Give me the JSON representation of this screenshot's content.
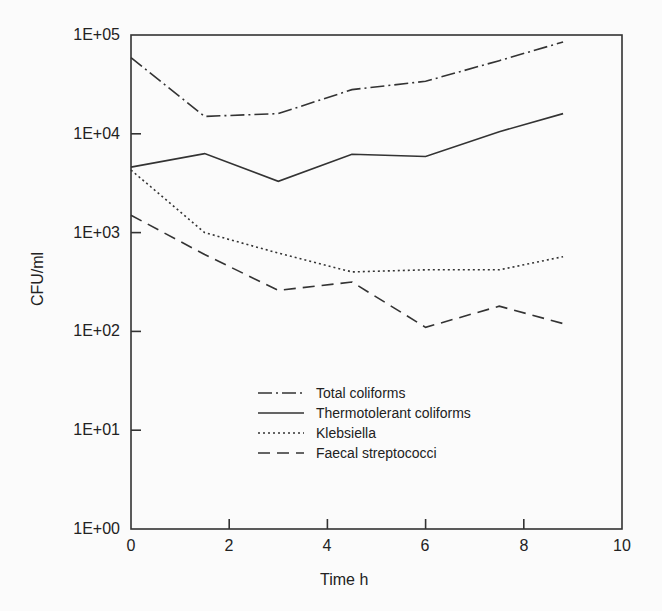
{
  "chart_data": {
    "type": "line",
    "title": "",
    "xlabel": "Time h",
    "ylabel": "CFU/ml",
    "xlim": [
      0,
      10
    ],
    "ylim": [
      1,
      100000
    ],
    "yscale": "log",
    "grid": false,
    "legend_position": "center-lower",
    "x_ticks": [
      "0",
      "2",
      "4",
      "6",
      "8",
      "10"
    ],
    "y_ticks": [
      "1E+00",
      "1E+01",
      "1E+02",
      "1E+03",
      "1E+04",
      "1E+05"
    ],
    "x": [
      0,
      1.5,
      3,
      4.5,
      6,
      7.5,
      8.8
    ],
    "series": [
      {
        "name": "Total coliforms",
        "style": "dashdot",
        "values": [
          59000,
          15000,
          16000,
          28000,
          34000,
          55000,
          85000
        ]
      },
      {
        "name": "Thermotolerant coliforms",
        "style": "solid",
        "values": [
          4600,
          6300,
          3300,
          6200,
          5900,
          10500,
          16000
        ]
      },
      {
        "name": "Klebsiella",
        "style": "dotted",
        "values": [
          4300,
          1000,
          620,
          400,
          420,
          420,
          570
        ]
      },
      {
        "name": "Faecal streptococci",
        "style": "dashed",
        "values": [
          1500,
          600,
          260,
          316,
          110,
          180,
          120
        ]
      }
    ]
  },
  "axes": {
    "xlabel": "Time h",
    "ylabel": "CFU/ml",
    "x_ticks": [
      "0",
      "2",
      "4",
      "6",
      "8",
      "10"
    ],
    "y_ticks": [
      "1E+05",
      "1E+04",
      "1E+03",
      "1E+02",
      "1E+01",
      "1E+00"
    ]
  },
  "legend": [
    "Total coliforms",
    "Thermotolerant coliforms",
    "Klebsiella",
    "Faecal streptococci"
  ]
}
